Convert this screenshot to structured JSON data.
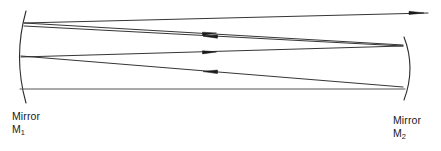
{
  "figure": {
    "type": "optical-ray-diagram",
    "background_color": "#ffffff",
    "line_color": "#2a2a2a",
    "line_width": 1,
    "width": 441,
    "height": 151
  },
  "labels": {
    "left_mirror": {
      "name_line": "Mirror",
      "symbol_letter": "M",
      "symbol_subscript": "1",
      "full": "Mirror M1"
    },
    "right_mirror": {
      "name_line": "Mirror",
      "symbol_letter": "M",
      "symbol_subscript": "2",
      "full": "Mirror M2"
    }
  },
  "mirrors": [
    {
      "id": "M1",
      "side": "left",
      "shape": "concave-arc",
      "curvature": "bulges-left",
      "path": "M 26 11 Q 13 57 26 103",
      "top_y": 11,
      "bottom_y": 103,
      "vertex_x": 15,
      "vertex_y": 57
    },
    {
      "id": "M2",
      "side": "right",
      "shape": "concave-arc",
      "curvature": "bulges-right",
      "path": "M 404 37 Q 416 68 404 100",
      "top_y": 37,
      "bottom_y": 100,
      "vertex_x": 414,
      "vertex_y": 68
    }
  ],
  "rays": [
    {
      "id": "ray-1",
      "description": "Upper ray travelling from mirror M1 to mirror M2",
      "direction": "rightward",
      "from": "M1",
      "to": "M2",
      "path": "M 22 23 L 402 45",
      "arrow_at": {
        "x": 212,
        "y": 34,
        "direction": "right"
      }
    },
    {
      "id": "ray-2",
      "description": "Upper ray travelling back from mirror M2 to mirror M1",
      "direction": "leftward",
      "from": "M2",
      "to": "M1",
      "path": "M 402 46 L 22 25",
      "arrow_at": {
        "x": 212,
        "y": 36,
        "direction": "left"
      }
    },
    {
      "id": "ray-3",
      "description": "Lower ray travelling from mirror M1 to mirror M2",
      "direction": "rightward",
      "from": "M1",
      "to": "M2",
      "path": "M 20 56 L 402 88",
      "arrow_at": {
        "x": 212,
        "y": 72,
        "direction": "right"
      }
    },
    {
      "id": "ray-4",
      "description": "Lower ray travelling back from mirror M2 to mirror M1",
      "direction": "leftward",
      "from": "M2",
      "to": "M1",
      "path": "M 402 46 L 20 58",
      "arrow_at": {
        "x": 212,
        "y": 53,
        "direction": "left"
      }
    },
    {
      "id": "ray-5",
      "description": "Axial ray along the cavity axis from mirror M1 to mirror M2",
      "direction": "rightward",
      "from": "M1",
      "to": "M2",
      "path": "M 20 88 L 404 88",
      "arrow_at": null
    },
    {
      "id": "ray-6",
      "description": "Output beam leaving the cavity past mirror M2",
      "direction": "rightward",
      "from": "M1",
      "to": "exit",
      "path": "M 22 23 L 430 13",
      "arrow_at": {
        "x": 415,
        "y": 13,
        "direction": "right"
      }
    }
  ],
  "arrowheads": [
    {
      "id": "arrow-mid-1",
      "x": 212,
      "y": 34,
      "direction": "right"
    },
    {
      "id": "arrow-mid-2",
      "x": 212,
      "y": 36,
      "direction": "left"
    },
    {
      "id": "arrow-mid-3",
      "x": 212,
      "y": 53,
      "direction": "left"
    },
    {
      "id": "arrow-mid-4",
      "x": 212,
      "y": 72,
      "direction": "right"
    },
    {
      "id": "arrow-exit",
      "x": 418,
      "y": 13,
      "direction": "right"
    }
  ]
}
